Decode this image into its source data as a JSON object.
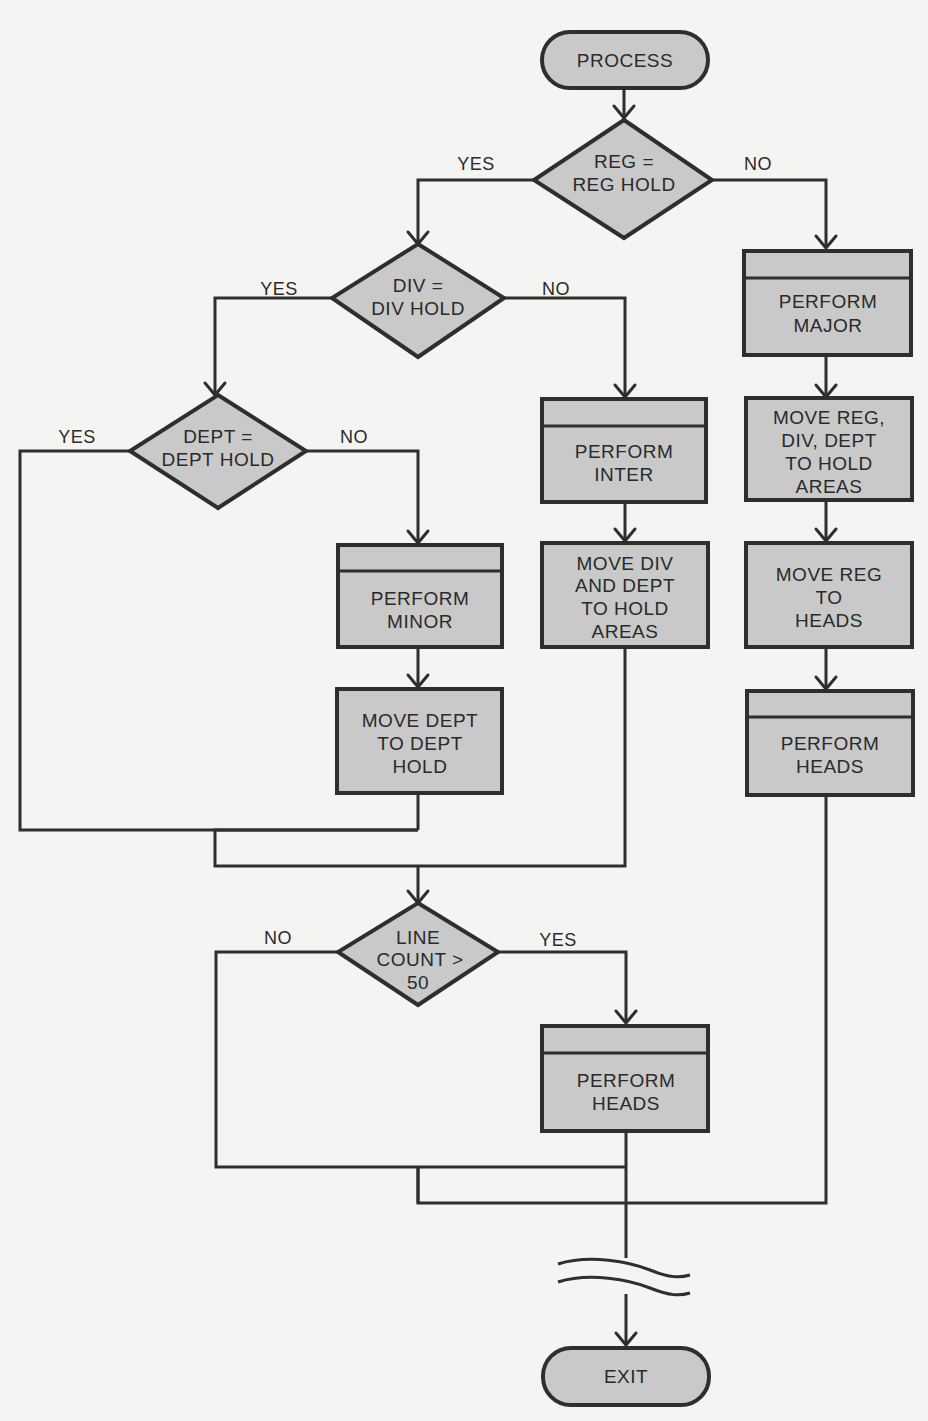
{
  "diagram": {
    "type": "flowchart",
    "nodes": {
      "start": {
        "kind": "terminal",
        "lines": [
          "PROCESS"
        ]
      },
      "reg_decision": {
        "kind": "decision",
        "lines": [
          "REG =",
          "REG HOLD"
        ]
      },
      "div_decision": {
        "kind": "decision",
        "lines": [
          "DIV =",
          "DIV HOLD"
        ]
      },
      "dept_decision": {
        "kind": "decision",
        "lines": [
          "DEPT =",
          "DEPT HOLD"
        ]
      },
      "perform_major": {
        "kind": "predefined-process",
        "lines": [
          "PERFORM",
          "MAJOR"
        ]
      },
      "move_reg_div_dept": {
        "kind": "process",
        "lines": [
          "MOVE REG,",
          "DIV, DEPT",
          "TO HOLD",
          "AREAS"
        ]
      },
      "move_reg_heads": {
        "kind": "process",
        "lines": [
          "MOVE REG",
          "TO",
          "HEADS"
        ]
      },
      "perform_heads_right": {
        "kind": "predefined-process",
        "lines": [
          "PERFORM",
          "HEADS"
        ]
      },
      "perform_inter": {
        "kind": "predefined-process",
        "lines": [
          "PERFORM",
          "INTER"
        ]
      },
      "move_div_dept": {
        "kind": "process",
        "lines": [
          "MOVE DIV",
          "AND DEPT",
          "TO HOLD",
          "AREAS"
        ]
      },
      "perform_minor": {
        "kind": "predefined-process",
        "lines": [
          "PERFORM",
          "MINOR"
        ]
      },
      "move_dept": {
        "kind": "process",
        "lines": [
          "MOVE DEPT",
          "TO DEPT",
          "HOLD"
        ]
      },
      "line_count_decision": {
        "kind": "decision",
        "lines": [
          "LINE",
          "COUNT >",
          "50"
        ]
      },
      "perform_heads_bottom": {
        "kind": "predefined-process",
        "lines": [
          "PERFORM",
          "HEADS"
        ]
      },
      "exit": {
        "kind": "terminal",
        "lines": [
          "EXIT"
        ]
      }
    },
    "edge_labels": {
      "reg_yes": "YES",
      "reg_no": "NO",
      "div_yes": "YES",
      "div_no": "NO",
      "dept_yes": "YES",
      "dept_no": "NO",
      "line_no": "NO",
      "line_yes": "YES"
    },
    "edges": [
      {
        "from": "start",
        "to": "reg_decision"
      },
      {
        "from": "reg_decision",
        "to": "div_decision",
        "label": "YES"
      },
      {
        "from": "reg_decision",
        "to": "perform_major",
        "label": "NO"
      },
      {
        "from": "perform_major",
        "to": "move_reg_div_dept"
      },
      {
        "from": "move_reg_div_dept",
        "to": "move_reg_heads"
      },
      {
        "from": "move_reg_heads",
        "to": "perform_heads_right"
      },
      {
        "from": "div_decision",
        "to": "dept_decision",
        "label": "YES"
      },
      {
        "from": "div_decision",
        "to": "perform_inter",
        "label": "NO"
      },
      {
        "from": "perform_inter",
        "to": "move_div_dept"
      },
      {
        "from": "dept_decision",
        "to": "line_count_decision",
        "label": "YES"
      },
      {
        "from": "dept_decision",
        "to": "perform_minor",
        "label": "NO"
      },
      {
        "from": "perform_minor",
        "to": "move_dept"
      },
      {
        "from": "move_dept",
        "to": "line_count_decision"
      },
      {
        "from": "move_div_dept",
        "to": "line_count_decision"
      },
      {
        "from": "line_count_decision",
        "to": "exit",
        "label": "NO"
      },
      {
        "from": "line_count_decision",
        "to": "perform_heads_bottom",
        "label": "YES"
      },
      {
        "from": "perform_heads_bottom",
        "to": "exit"
      },
      {
        "from": "perform_heads_right",
        "to": "exit"
      }
    ]
  }
}
